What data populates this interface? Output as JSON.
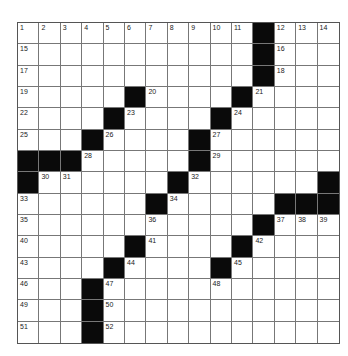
{
  "puzzle": {
    "rows": 15,
    "cols": 15,
    "colors": {
      "black": "#0a0a0a",
      "white": "#ffffff",
      "line": "#777777"
    },
    "black_cells": [
      [
        0,
        11
      ],
      [
        1,
        11
      ],
      [
        2,
        11
      ],
      [
        3,
        5
      ],
      [
        3,
        10
      ],
      [
        4,
        4
      ],
      [
        4,
        9
      ],
      [
        5,
        3
      ],
      [
        5,
        8
      ],
      [
        6,
        0
      ],
      [
        6,
        1
      ],
      [
        6,
        2
      ],
      [
        6,
        8
      ],
      [
        7,
        0
      ],
      [
        7,
        7
      ],
      [
        7,
        14
      ],
      [
        8,
        6
      ],
      [
        8,
        12
      ],
      [
        8,
        13
      ],
      [
        8,
        14
      ],
      [
        9,
        11
      ],
      [
        10,
        5
      ],
      [
        10,
        10
      ],
      [
        11,
        4
      ],
      [
        11,
        9
      ],
      [
        12,
        3
      ],
      [
        13,
        3
      ],
      [
        14,
        3
      ]
    ],
    "numbers": [
      {
        "r": 0,
        "c": 0,
        "n": "1"
      },
      {
        "r": 0,
        "c": 1,
        "n": "2"
      },
      {
        "r": 0,
        "c": 2,
        "n": "3"
      },
      {
        "r": 0,
        "c": 3,
        "n": "4"
      },
      {
        "r": 0,
        "c": 4,
        "n": "5"
      },
      {
        "r": 0,
        "c": 5,
        "n": "6"
      },
      {
        "r": 0,
        "c": 6,
        "n": "7"
      },
      {
        "r": 0,
        "c": 7,
        "n": "8"
      },
      {
        "r": 0,
        "c": 8,
        "n": "9"
      },
      {
        "r": 0,
        "c": 9,
        "n": "10"
      },
      {
        "r": 0,
        "c": 10,
        "n": "11"
      },
      {
        "r": 0,
        "c": 12,
        "n": "12"
      },
      {
        "r": 0,
        "c": 13,
        "n": "13"
      },
      {
        "r": 0,
        "c": 14,
        "n": "14"
      },
      {
        "r": 1,
        "c": 0,
        "n": "15"
      },
      {
        "r": 1,
        "c": 12,
        "n": "16"
      },
      {
        "r": 2,
        "c": 0,
        "n": "17"
      },
      {
        "r": 2,
        "c": 12,
        "n": "18"
      },
      {
        "r": 3,
        "c": 0,
        "n": "19"
      },
      {
        "r": 3,
        "c": 6,
        "n": "20"
      },
      {
        "r": 3,
        "c": 11,
        "n": "21"
      },
      {
        "r": 4,
        "c": 0,
        "n": "22"
      },
      {
        "r": 4,
        "c": 5,
        "n": "23"
      },
      {
        "r": 4,
        "c": 10,
        "n": "24"
      },
      {
        "r": 5,
        "c": 0,
        "n": "25"
      },
      {
        "r": 5,
        "c": 4,
        "n": "26"
      },
      {
        "r": 5,
        "c": 9,
        "n": "27"
      },
      {
        "r": 6,
        "c": 3,
        "n": "28"
      },
      {
        "r": 6,
        "c": 9,
        "n": "29"
      },
      {
        "r": 7,
        "c": 1,
        "n": "30"
      },
      {
        "r": 7,
        "c": 2,
        "n": "31"
      },
      {
        "r": 7,
        "c": 8,
        "n": "32"
      },
      {
        "r": 8,
        "c": 0,
        "n": "33"
      },
      {
        "r": 8,
        "c": 7,
        "n": "34"
      },
      {
        "r": 9,
        "c": 0,
        "n": "35"
      },
      {
        "r": 9,
        "c": 6,
        "n": "36"
      },
      {
        "r": 9,
        "c": 12,
        "n": "37"
      },
      {
        "r": 9,
        "c": 13,
        "n": "38"
      },
      {
        "r": 9,
        "c": 14,
        "n": "39"
      },
      {
        "r": 10,
        "c": 0,
        "n": "40"
      },
      {
        "r": 10,
        "c": 6,
        "n": "41"
      },
      {
        "r": 10,
        "c": 11,
        "n": "42"
      },
      {
        "r": 11,
        "c": 0,
        "n": "43"
      },
      {
        "r": 11,
        "c": 5,
        "n": "44"
      },
      {
        "r": 11,
        "c": 10,
        "n": "45"
      },
      {
        "r": 12,
        "c": 0,
        "n": "46"
      },
      {
        "r": 12,
        "c": 4,
        "n": "47"
      },
      {
        "r": 12,
        "c": 9,
        "n": "48"
      },
      {
        "r": 13,
        "c": 0,
        "n": "49"
      },
      {
        "r": 13,
        "c": 4,
        "n": "50"
      },
      {
        "r": 14,
        "c": 0,
        "n": "51"
      },
      {
        "r": 14,
        "c": 4,
        "n": "52"
      }
    ]
  }
}
